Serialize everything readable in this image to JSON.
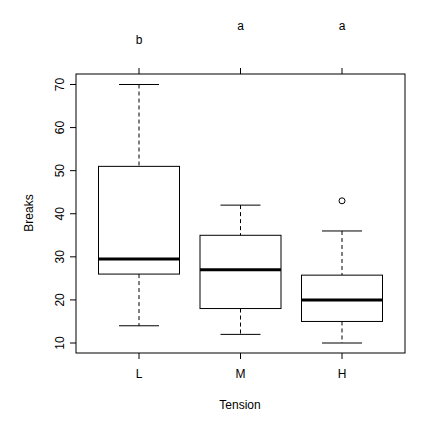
{
  "chart_data": {
    "type": "box",
    "title": "",
    "xlabel": "Tension",
    "ylabel": "Breaks",
    "ylim": [
      8,
      72
    ],
    "yticks": [
      10,
      20,
      30,
      40,
      50,
      60,
      70
    ],
    "grid": false,
    "legend": null,
    "categories": [
      "L",
      "M",
      "H"
    ],
    "group_letters": [
      "b",
      "a",
      "a"
    ],
    "boxes": [
      {
        "category": "L",
        "whisker_low": 14,
        "q1": 26,
        "median": 29.5,
        "q3": 51,
        "whisker_high": 70,
        "outliers": []
      },
      {
        "category": "M",
        "whisker_low": 12,
        "q1": 18,
        "median": 27,
        "q3": 35,
        "whisker_high": 42,
        "outliers": []
      },
      {
        "category": "H",
        "whisker_low": 10,
        "q1": 15,
        "median": 20,
        "q3": 25.75,
        "whisker_high": 36,
        "outliers": [
          43
        ]
      }
    ]
  }
}
